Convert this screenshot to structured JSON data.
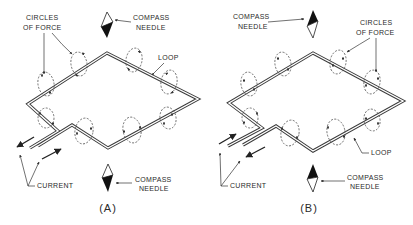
{
  "figure": {
    "panels": [
      {
        "id": "A",
        "caption": "(A)",
        "labels": {
          "circles_of_force": [
            "CIRCLES",
            "OF FORCE"
          ],
          "compass_needle_top": [
            "COMPASS",
            "NEEDLE"
          ],
          "loop": "LOOP",
          "current": "CURRENT",
          "compass_needle_bottom": [
            "COMPASS",
            "NEEDLE"
          ]
        },
        "needle_top": "black-tip-down",
        "needle_bottom": "black-tip-down"
      },
      {
        "id": "B",
        "caption": "(B)",
        "labels": {
          "compass_needle_top": [
            "COMPASS",
            "NEEDLE"
          ],
          "circles_of_force": [
            "CIRCLES",
            "OF FORCE"
          ],
          "loop": "LOOP",
          "current": "CURRENT",
          "compass_needle_bottom": [
            "COMPASS",
            "NEEDLE"
          ]
        },
        "needle_top": "black-tip-up",
        "needle_bottom": "black-tip-up"
      }
    ],
    "icons": [
      "compass-needle-icon",
      "current-arrow-icon",
      "circle-of-force-icon"
    ],
    "colors": {
      "ink": "#2a2a2a",
      "background": "#ffffff"
    }
  }
}
